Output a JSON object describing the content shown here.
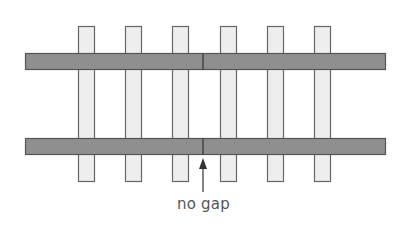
{
  "diagram": {
    "type": "railway-track-continuous-welded-rail",
    "colors": {
      "rail_fill": "#8f8f8f",
      "rail_stroke": "#555555",
      "sleeper_fill": "#eeeeee",
      "sleeper_stroke": "#666666",
      "text": "#555555",
      "arrow": "#333333"
    },
    "rails": [
      {
        "name": "top-rail",
        "x": 25,
        "y": 53,
        "width": 360,
        "height": 16,
        "joint_x": 203
      },
      {
        "name": "bottom-rail",
        "x": 25,
        "y": 138,
        "width": 360,
        "height": 16,
        "joint_x": 203
      }
    ],
    "sleepers": [
      {
        "x": 78,
        "width": 16
      },
      {
        "x": 125,
        "width": 16
      },
      {
        "x": 172,
        "width": 16
      },
      {
        "x": 220,
        "width": 16
      },
      {
        "x": 267,
        "width": 16
      },
      {
        "x": 314,
        "width": 16
      }
    ],
    "sleeper_top": 26,
    "sleeper_bottom": 181,
    "annotation": {
      "label": "no gap",
      "arrow_x": 203,
      "arrow_from_y": 192,
      "arrow_to_y": 158
    }
  }
}
